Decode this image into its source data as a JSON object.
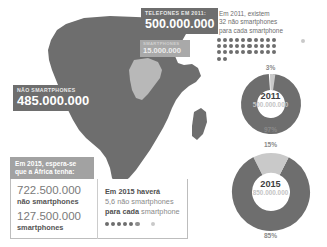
{
  "map": {
    "name": "africa-map",
    "continent_color": "#6e6e6e",
    "inset_color": "#b8b8b8"
  },
  "banners": {
    "telefones": {
      "caption": "TELEFONES EM 2011:",
      "value": "500.000.000"
    },
    "nao_smartphones": {
      "caption": "NÃO SMARTPHONES",
      "value": "485.000.000"
    },
    "smartphones": {
      "caption": "SMARTPHONES",
      "value": "15.000.000"
    }
  },
  "panel_2015": {
    "header_line1": "Em 2015, espera-se",
    "header_line2": "que a África tenha:",
    "stats": [
      {
        "number": "722.500.000",
        "label": "não smartphones"
      },
      {
        "number": "127.500.000",
        "label": "smartphones"
      }
    ],
    "ratio": {
      "line1": "Em 2015 haverá",
      "line2": "5,6 não smartphones",
      "line3_bold": "para cada ",
      "line3_rest": "smartphone",
      "dark_dots": 6,
      "light_dots": 1
    }
  },
  "right": {
    "ratio_2011": {
      "line1": "Em 2011, existem",
      "line2": "32 não smartphones",
      "line3": "para cada smartphone",
      "dark_dots": 32,
      "light_dots": 1,
      "dots_per_row": 10
    },
    "donuts": [
      {
        "year": "2011",
        "total": "500.000.000",
        "top_pct": "3%",
        "bottom_pct": "97%",
        "smartphone_share": 3,
        "non_smartphone_share": 97
      },
      {
        "year": "2015",
        "total": "850.000.000",
        "top_pct": "15%",
        "bottom_pct": "85%",
        "smartphone_share": 15,
        "non_smartphone_share": 85
      }
    ]
  },
  "colors": {
    "dark_gray": "#6e6e6e",
    "mid_gray": "#a2a2a2",
    "light_gray": "#c9c9c9",
    "white": "#ffffff"
  },
  "chart_data": [
    {
      "type": "pie",
      "title": "2011",
      "subtitle": "500.000.000",
      "labels": [
        "smartphones",
        "não smartphones"
      ],
      "values": [
        3,
        97
      ],
      "value_labels": [
        "3%",
        "97%"
      ],
      "colors": [
        "#c9c9c9",
        "#6e6e6e"
      ],
      "donut": true,
      "legend": "none"
    },
    {
      "type": "pie",
      "title": "2015",
      "subtitle": "850.000.000",
      "labels": [
        "smartphones",
        "não smartphones"
      ],
      "values": [
        15,
        85
      ],
      "value_labels": [
        "15%",
        "85%"
      ],
      "colors": [
        "#c9c9c9",
        "#6e6e6e"
      ],
      "donut": true,
      "legend": "none"
    }
  ]
}
